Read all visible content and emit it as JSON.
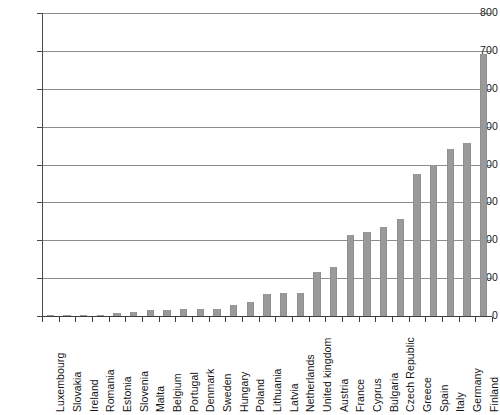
{
  "chart_data": {
    "type": "bar",
    "title": "",
    "subtitle": "",
    "xlabel": "",
    "ylabel": "",
    "ylim": [
      0,
      800
    ],
    "ytick_step": 100,
    "yticks": [
      0,
      100,
      200,
      300,
      400,
      500,
      600,
      700,
      800
    ],
    "ytick_labels": [
      "0",
      "100",
      "200",
      "300",
      "400",
      "500",
      "600",
      "700",
      "800"
    ],
    "grid": "horizontal",
    "legend": "none",
    "bar_color": "#9a9a9a",
    "axis_color": "#3d3d3d",
    "gridline_color": "#8d8d8d",
    "categories": [
      "Luxembourg",
      "Slovakia",
      "Ireland",
      "Romania",
      "Estonia",
      "Slovenia",
      "Malta",
      "Belgium",
      "Portugal",
      "Denmark",
      "Sweden",
      "Hungary",
      "Poland",
      "Lithuania",
      "Latvia",
      "Netherlands",
      "United kingdom",
      "Austria",
      "France",
      "Cyprus",
      "Bulgaria",
      "Czech Republic",
      "Greece",
      "Spain",
      "Italy",
      "Germany",
      "Finland"
    ],
    "values": [
      1,
      1,
      1,
      2,
      9,
      10,
      16,
      17,
      18,
      18,
      19,
      28,
      38,
      58,
      60,
      60,
      115,
      130,
      215,
      222,
      235,
      255,
      375,
      398,
      440,
      457,
      692
    ]
  },
  "caption": {
    "text": ""
  }
}
